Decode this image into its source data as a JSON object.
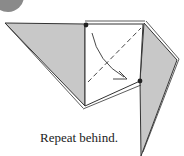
{
  "diagram": {
    "caption": "Repeat behind.",
    "colors": {
      "paper_gray": "#c8c8c8",
      "paper_white": "#ffffff",
      "line": "#333333",
      "step_circle": "#888888"
    },
    "elements": [
      "left-flap",
      "center-square",
      "right-flap",
      "valley-fold-line",
      "fold-arrow",
      "reference-dot-top",
      "reference-dot-bottom"
    ]
  }
}
